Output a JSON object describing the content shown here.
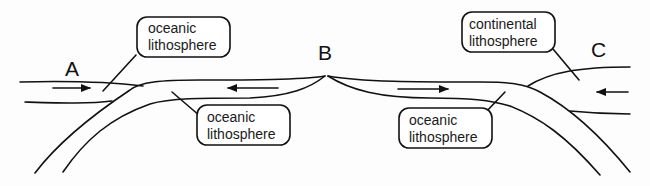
{
  "diagram": {
    "points": {
      "a": "A",
      "b": "B",
      "c": "C"
    },
    "labels": {
      "top_left": {
        "line1": "oceanic",
        "line2": "lithosphere"
      },
      "bottom_left": {
        "line1": "oceanic",
        "line2": "lithosphere"
      },
      "bottom_right": {
        "line1": "oceanic",
        "line2": "lithosphere"
      },
      "top_right": {
        "line1": "continental",
        "line2": "lithosphere"
      }
    },
    "arrows": [
      {
        "name": "arrow-at-a",
        "direction": "right"
      },
      {
        "name": "arrow-left-of-b",
        "direction": "left"
      },
      {
        "name": "arrow-right-of-b",
        "direction": "right"
      },
      {
        "name": "arrow-at-c",
        "direction": "left"
      }
    ]
  }
}
